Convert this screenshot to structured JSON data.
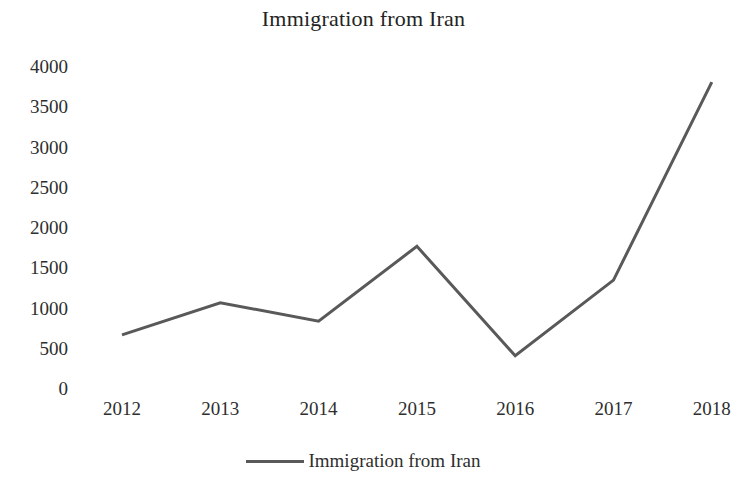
{
  "chart_data": {
    "type": "line",
    "title": "Immigration from Iran",
    "xlabel": "",
    "ylabel": "",
    "categories": [
      "2012",
      "2013",
      "2014",
      "2015",
      "2016",
      "2017",
      "2018"
    ],
    "series": [
      {
        "name": "Immigration from Iran",
        "values": [
          660,
          1060,
          830,
          1760,
          400,
          1340,
          3800
        ],
        "color": "#595959"
      }
    ],
    "ylim": [
      0,
      4000
    ],
    "y_ticks": [
      "0",
      "500",
      "1000",
      "1500",
      "2000",
      "2500",
      "3000",
      "3500",
      "4000"
    ],
    "y_tick_values": [
      0,
      500,
      1000,
      1500,
      2000,
      2500,
      3000,
      3500,
      4000
    ],
    "grid": false,
    "legend_position": "bottom",
    "legend_entries": [
      "Immigration from Iran"
    ]
  },
  "legend": {
    "label": "Immigration from Iran",
    "swatch_name": "line-swatch"
  }
}
